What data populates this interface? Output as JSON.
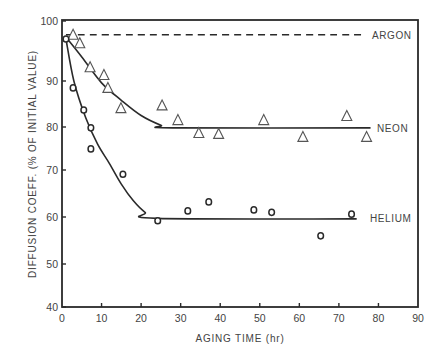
{
  "chart_data": {
    "type": "scatter",
    "title": "",
    "xlabel": "AGING TIME (hr)",
    "ylabel": "DIFFUSION COEFF. (% OF INITIAL VALUE)",
    "xlim": [
      0,
      90
    ],
    "ylim": [
      40,
      100
    ],
    "x_ticks": [
      0,
      10,
      20,
      30,
      40,
      50,
      60,
      70,
      80,
      90
    ],
    "y_ticks": [
      40,
      50,
      60,
      70,
      80,
      90,
      100
    ],
    "grid": false,
    "legend": "inline labels at right end of curves",
    "series": [
      {
        "name": "ARGON",
        "marker": "none",
        "line": "dashed",
        "x": [
          1,
          76
        ],
        "y": [
          97.7,
          97.7
        ]
      },
      {
        "name": "NEON",
        "marker": "triangle",
        "line": "solid fitted curve",
        "x": [
          2.8,
          4.5,
          7.1,
          10.6,
          11.6,
          14.9,
          25.3,
          29.3,
          34.6,
          39.6,
          51.0,
          60.9,
          72.0,
          77.0
        ],
        "y": [
          97.7,
          96.3,
          92.3,
          91.0,
          88.5,
          84.1,
          84.7,
          81.5,
          78.6,
          78.4,
          81.5,
          77.7,
          82.4,
          77.7
        ],
        "fit_curve": {
          "x": [
            1,
            5,
            10,
            15,
            20,
            25,
            28,
            78
          ],
          "y": [
            97.3,
            94.0,
            89.6,
            85.8,
            82.5,
            80.4,
            79.8,
            79.8
          ]
        }
      },
      {
        "name": "HELIUM",
        "marker": "circle",
        "line": "solid fitted curve",
        "x": [
          1.0,
          2.8,
          5.5,
          7.3,
          7.3,
          15.4,
          24.2,
          31.8,
          37.1,
          48.5,
          53.0,
          65.4,
          73.2
        ],
        "y": [
          97.0,
          88.5,
          83.7,
          79.8,
          74.9,
          69.1,
          59.2,
          61.3,
          63.2,
          61.5,
          61.0,
          56.0,
          60.6
        ],
        "fit_curve": {
          "x": [
            1,
            3,
            6,
            9,
            12,
            15,
            18,
            21,
            24,
            74.5
          ],
          "y": [
            97.0,
            90.0,
            82.0,
            76.0,
            71.5,
            67.0,
            63.5,
            61.0,
            59.7,
            59.6
          ]
        }
      }
    ]
  },
  "labels": {
    "argon": "ARGON",
    "neon": "NEON",
    "helium": "HELIUM",
    "xlabel": "AGING TIME (hr)",
    "ylabel": "DIFFUSION COEFF. (% OF INITIAL VALUE)"
  },
  "colors": {
    "ink": "#2a2a2a",
    "text": "#444444",
    "background": "#ffffff"
  }
}
